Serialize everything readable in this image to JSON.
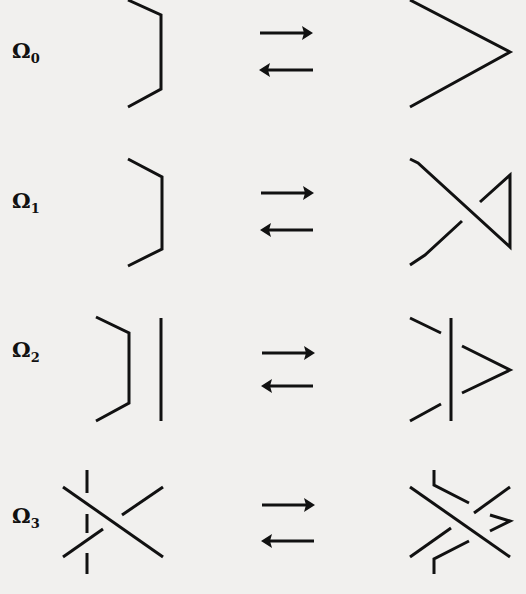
{
  "moves": [
    {
      "symbol": "Ω",
      "index": "0",
      "relation": "⇄"
    },
    {
      "symbol": "Ω",
      "index": "1",
      "relation": "⇄"
    },
    {
      "symbol": "Ω",
      "index": "2",
      "relation": "⇄"
    },
    {
      "symbol": "Ω",
      "index": "3",
      "relation": "⇄"
    }
  ],
  "colors": {
    "ink": "#111111",
    "paper": "#f1f0ee"
  }
}
